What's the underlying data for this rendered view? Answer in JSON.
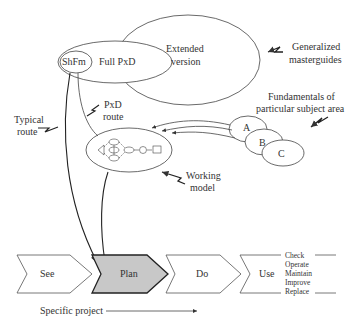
{
  "top_label": {
    "text": "...project"
  },
  "ellipses": {
    "shfm": "ShFm",
    "full_pxd": "Full PxD",
    "extended": [
      "Extended",
      "version"
    ]
  },
  "annotations": {
    "generalized": [
      "Generalized",
      "masterguides"
    ],
    "fundamentals": [
      "Fundamentals of",
      "particular subject area"
    ],
    "typical_route": [
      "Typical",
      "route"
    ],
    "pxd_route": [
      "PxD",
      "route"
    ],
    "working_model": [
      "Working",
      "model"
    ]
  },
  "subject_areas": [
    "A",
    "B",
    "C"
  ],
  "working_model_nodes": [
    "1",
    "2",
    "3",
    "4",
    "5",
    "6"
  ],
  "process_steps": [
    {
      "label": "See",
      "highlighted": false
    },
    {
      "label": "Plan",
      "highlighted": true
    },
    {
      "label": "Do",
      "highlighted": false
    },
    {
      "label": "Use",
      "highlighted": false
    }
  ],
  "use_activities": [
    "Check",
    "Operate",
    "Maintain",
    "Improve",
    "Replace"
  ],
  "specific_project": "Specific project",
  "colors": {
    "line": "#333333",
    "highlight_fill": "#c8c8c8"
  }
}
